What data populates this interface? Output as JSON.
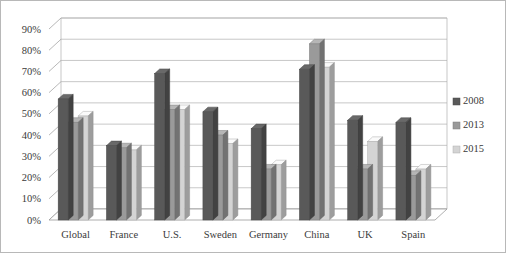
{
  "chart": {
    "title": "",
    "frame_color": "#b8b8b8",
    "background": "#ffffff",
    "gridline_color": "#b0b0b0",
    "axis_color": "#9a9a9a"
  },
  "axes": {
    "y_ticks": [
      "0%",
      "10%",
      "20%",
      "30%",
      "40%",
      "50%",
      "60%",
      "70%",
      "80%",
      "90%"
    ],
    "y_min": 0,
    "y_max": 90,
    "y_step": 10,
    "x_categories": [
      "Global",
      "France",
      "U.S.",
      "Sweden",
      "Germany",
      "China",
      "UK",
      "Spain"
    ]
  },
  "legend": {
    "position": "right",
    "entries": [
      {
        "label": "2008",
        "color": "#595959"
      },
      {
        "label": "2013",
        "color": "#9a9a9a"
      },
      {
        "label": "2015",
        "color": "#d4d4d4"
      }
    ]
  },
  "chart_data": {
    "type": "bar",
    "title": "",
    "xlabel": "",
    "ylabel": "",
    "ylim": [
      0,
      90
    ],
    "y_unit": "%",
    "grid": true,
    "legend_position": "right",
    "categories": [
      "Global",
      "France",
      "U.S.",
      "Sweden",
      "Germany",
      "China",
      "UK",
      "Spain"
    ],
    "series": [
      {
        "name": "2008",
        "color": "#595959",
        "values": [
          57,
          35,
          69,
          51,
          43,
          71,
          47,
          46
        ]
      },
      {
        "name": "2013",
        "color": "#9a9a9a",
        "values": [
          46,
          34,
          52,
          40,
          24,
          83,
          24,
          21
        ]
      },
      {
        "name": "2015",
        "color": "#d4d4d4",
        "values": [
          49,
          33,
          52,
          36,
          26,
          72,
          37,
          24
        ]
      }
    ]
  }
}
